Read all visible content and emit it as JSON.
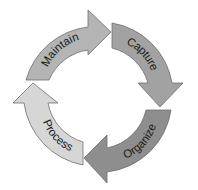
{
  "diagram": {
    "type": "cycle",
    "direction": "clockwise",
    "segments": [
      {
        "id": "maintain",
        "label": "Maintain",
        "color": "#b4b4b4"
      },
      {
        "id": "capture",
        "label": "Capture",
        "color": "#a2a2a2"
      },
      {
        "id": "organize",
        "label": "Organize",
        "color": "#8e8e8e"
      },
      {
        "id": "process",
        "label": "Process",
        "color": "#d6d6d6"
      }
    ],
    "stroke_color": "#6e6e6e"
  }
}
